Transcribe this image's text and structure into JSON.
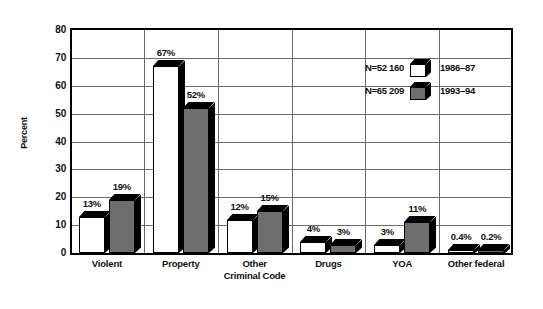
{
  "chart_data": {
    "type": "bar",
    "title": "",
    "subtitle": "",
    "xlabel": "",
    "ylabel": "Percent",
    "ylim": [
      0,
      80
    ],
    "ytick_step": 10,
    "yticks": [
      "80",
      "70",
      "60",
      "50",
      "40",
      "30",
      "20",
      "10",
      "0"
    ],
    "grid": true,
    "legend_position": "upper-right",
    "categories": [
      "Violent",
      "Property",
      "Other Criminal Code",
      "Drugs",
      "YOA",
      "Other federal"
    ],
    "category_lines": [
      [
        "Violent",
        ""
      ],
      [
        "Property",
        ""
      ],
      [
        "Other",
        "Criminal Code"
      ],
      [
        "Drugs",
        ""
      ],
      [
        "YOA",
        ""
      ],
      [
        "Other federal",
        ""
      ]
    ],
    "series": [
      {
        "name": "1986–87",
        "n_label": "N=52 160",
        "color": "#ffffff",
        "values": [
          13,
          67,
          12,
          4,
          3,
          0.4
        ],
        "labels": [
          "13%",
          "67%",
          "12%",
          "4%",
          "3%",
          "0.4%"
        ]
      },
      {
        "name": "1993–94",
        "n_label": "N=65 209",
        "color": "#6e6e6e",
        "values": [
          19,
          52,
          15,
          3,
          11,
          0.2
        ],
        "labels": [
          "19%",
          "52%",
          "15%",
          "3%",
          "11%",
          "0.2%"
        ]
      }
    ]
  },
  "colors": {
    "series_1": "#ffffff",
    "series_2": "#6e6e6e",
    "axis": "#000000",
    "grid": "#6a6a6a",
    "background": "#ffffff"
  },
  "legend": {
    "rows": [
      {
        "n_label": "N=52 160",
        "year": "1986–87",
        "swatch": "white-cube-icon"
      },
      {
        "n_label": "N=65 209",
        "year": "1993–94",
        "swatch": "gray-cube-icon"
      }
    ]
  }
}
